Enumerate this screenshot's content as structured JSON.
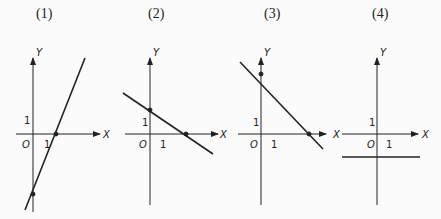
{
  "panels": [
    {
      "label": "(1)",
      "line": {
        "x_intercept": 2,
        "y_intercept": -5
      }
    },
    {
      "label": "(2)",
      "line": {
        "x_intercept": 3,
        "y_intercept": 2
      }
    },
    {
      "label": "(3)",
      "line": {
        "x_intercept": 4,
        "y_intercept": 5
      }
    },
    {
      "label": "(4)",
      "line": {
        "horizontal": true,
        "y": -2
      }
    }
  ],
  "axes": {
    "x": "X",
    "y": "Y",
    "origin": "O",
    "unit": "1"
  }
}
